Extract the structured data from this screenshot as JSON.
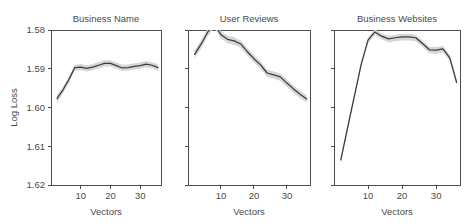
{
  "chart_data": {
    "type": "line",
    "title": "",
    "xlabel": "Vectors",
    "ylabel": "Log Loss",
    "xlim": [
      0,
      37
    ],
    "ylim": [
      1.58,
      1.62
    ],
    "y_inverted": true,
    "grid": false,
    "legend": "none",
    "yticks": [
      1.58,
      1.59,
      1.6,
      1.61,
      1.62
    ],
    "ytick_labels": [
      "1.58",
      "1.59",
      "1.60",
      "1.61",
      "1.62"
    ],
    "xticks": [
      10,
      20,
      30
    ],
    "xtick_labels": [
      "10",
      "20",
      "30"
    ],
    "band_label": "confidence interval",
    "panels": [
      {
        "title": "Business Name",
        "x": [
          2,
          4,
          6,
          8,
          10,
          12,
          14,
          16,
          18,
          20,
          22,
          24,
          26,
          28,
          30,
          32,
          34,
          36
        ],
        "values": [
          1.5977,
          1.5955,
          1.5928,
          1.5897,
          1.5896,
          1.5899,
          1.5896,
          1.5891,
          1.5886,
          1.5886,
          1.5892,
          1.5898,
          1.5897,
          1.5894,
          1.5892,
          1.5888,
          1.5891,
          1.5897
        ],
        "lower": [
          1.5968,
          1.5947,
          1.5921,
          1.589,
          1.5888,
          1.5891,
          1.5888,
          1.5883,
          1.5878,
          1.5878,
          1.5884,
          1.589,
          1.5889,
          1.5886,
          1.5884,
          1.588,
          1.5883,
          1.5888
        ],
        "upper": [
          1.5989,
          1.5964,
          1.5936,
          1.5905,
          1.5904,
          1.5907,
          1.5904,
          1.5899,
          1.5894,
          1.5894,
          1.59,
          1.5906,
          1.5905,
          1.5902,
          1.59,
          1.5896,
          1.5899,
          1.5906
        ]
      },
      {
        "title": "User Reviews",
        "x": [
          2,
          4,
          6,
          8,
          10,
          12,
          14,
          16,
          18,
          20,
          22,
          24,
          26,
          28,
          30,
          32,
          34,
          36
        ],
        "values": [
          1.5863,
          1.5836,
          1.5805,
          1.5785,
          1.5812,
          1.5824,
          1.5828,
          1.5836,
          1.5856,
          1.5874,
          1.589,
          1.5911,
          1.5916,
          1.5921,
          1.5937,
          1.5952,
          1.5966,
          1.5978
        ],
        "lower": [
          1.5853,
          1.5826,
          1.5795,
          1.5775,
          1.5803,
          1.5815,
          1.5819,
          1.5827,
          1.5847,
          1.5865,
          1.5881,
          1.5902,
          1.5907,
          1.5912,
          1.5928,
          1.5943,
          1.5957,
          1.5969
        ],
        "upper": [
          1.5874,
          1.5847,
          1.5816,
          1.5795,
          1.5822,
          1.5834,
          1.5838,
          1.5846,
          1.5866,
          1.5884,
          1.59,
          1.5921,
          1.5926,
          1.5931,
          1.5947,
          1.5962,
          1.5976,
          1.5988
        ]
      },
      {
        "title": "Business Websites",
        "x": [
          2,
          4,
          6,
          8,
          10,
          12,
          14,
          16,
          18,
          20,
          22,
          24,
          26,
          28,
          30,
          32,
          34,
          36
        ],
        "values": [
          1.6135,
          1.6052,
          1.597,
          1.5888,
          1.5826,
          1.5805,
          1.5816,
          1.5823,
          1.582,
          1.5818,
          1.5818,
          1.582,
          1.5835,
          1.5851,
          1.5852,
          1.5849,
          1.5872,
          1.5935
        ],
        "lower": [
          1.6127,
          1.6044,
          1.5963,
          1.5881,
          1.5819,
          1.5798,
          1.5809,
          1.5815,
          1.5812,
          1.581,
          1.581,
          1.5812,
          1.5827,
          1.5843,
          1.5844,
          1.5841,
          1.5864,
          1.5927
        ],
        "upper": [
          1.6145,
          1.6061,
          1.5978,
          1.5896,
          1.5834,
          1.5813,
          1.5824,
          1.5832,
          1.5829,
          1.5827,
          1.5827,
          1.5829,
          1.5844,
          1.586,
          1.5861,
          1.5858,
          1.588,
          1.5944
        ]
      }
    ],
    "colors": {
      "line": "#3b3b3b",
      "band": "#d4d4d4",
      "frame": "#4d4d4d",
      "text": "#4a4a4a",
      "background": "#ffffff"
    }
  }
}
